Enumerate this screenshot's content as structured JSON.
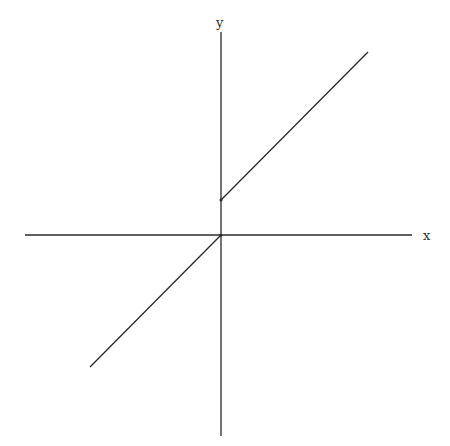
{
  "diagram": {
    "type": "piecewise-linear-graph",
    "axes": {
      "x_label": "x",
      "y_label": "y",
      "color": "#2a2a2a"
    },
    "lines": [
      {
        "name": "upper-branch",
        "description": "line for x >= 0 with positive y-intercept",
        "color": "#2a2a2a"
      },
      {
        "name": "lower-branch",
        "description": "line for x < 0 passing through origin",
        "color": "#2a2a2a"
      }
    ]
  }
}
